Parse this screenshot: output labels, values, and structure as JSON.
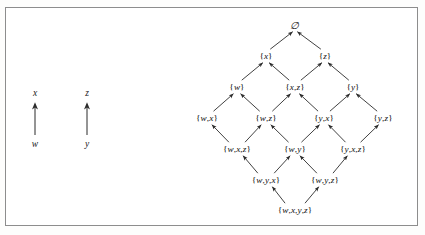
{
  "figure": {
    "background_color": "#ffffff",
    "border_color": "#8d8d8d",
    "line_color": "#2b2b2b",
    "text_color": "#111111"
  },
  "legend": {
    "pairs": [
      {
        "name": "pair-x-w",
        "top": "x",
        "bottom": "w",
        "arrow": "up-arrow-icon"
      },
      {
        "name": "pair-z-y",
        "top": "z",
        "bottom": "y",
        "arrow": "up-arrow-icon"
      }
    ]
  },
  "lattice": {
    "rows": [
      {
        "row": 1,
        "y": 25,
        "nodes": [
          {
            "id": "empty",
            "label": "∅",
            "x": 295
          }
        ]
      },
      {
        "row": 2,
        "y": 56,
        "nodes": [
          {
            "id": "x",
            "label": "{x}",
            "x": 266
          },
          {
            "id": "z",
            "label": "{z}",
            "x": 325
          }
        ]
      },
      {
        "row": 3,
        "y": 87,
        "nodes": [
          {
            "id": "w",
            "label": "{w}",
            "x": 237
          },
          {
            "id": "xz",
            "label": "{x,z}",
            "x": 295
          },
          {
            "id": "y",
            "label": "{y}",
            "x": 353
          }
        ]
      },
      {
        "row": 4,
        "y": 118,
        "nodes": [
          {
            "id": "wx",
            "label": "{w,x}",
            "x": 207
          },
          {
            "id": "wz",
            "label": "{w,z}",
            "x": 266
          },
          {
            "id": "yx",
            "label": "{y,x}",
            "x": 324
          },
          {
            "id": "yz",
            "label": "{y,z}",
            "x": 383
          }
        ]
      },
      {
        "row": 5,
        "y": 149,
        "nodes": [
          {
            "id": "wxz",
            "label": "{w,x,z}",
            "x": 237
          },
          {
            "id": "wy",
            "label": "{w,y}",
            "x": 295
          },
          {
            "id": "yxz",
            "label": "{y,x,z}",
            "x": 353
          }
        ]
      },
      {
        "row": 6,
        "y": 180,
        "nodes": [
          {
            "id": "wyx",
            "label": "{w,y,x}",
            "x": 266
          },
          {
            "id": "wyz",
            "label": "{w,y,z}",
            "x": 325
          }
        ]
      },
      {
        "row": 7,
        "y": 210,
        "nodes": [
          {
            "id": "wxyz",
            "label": "{w,x,y,z}",
            "x": 295
          }
        ]
      }
    ],
    "edges": [
      {
        "from": "x",
        "to": "empty"
      },
      {
        "from": "z",
        "to": "empty"
      },
      {
        "from": "w",
        "to": "x"
      },
      {
        "from": "xz",
        "to": "x"
      },
      {
        "from": "xz",
        "to": "z"
      },
      {
        "from": "y",
        "to": "z"
      },
      {
        "from": "wx",
        "to": "w"
      },
      {
        "from": "wz",
        "to": "w"
      },
      {
        "from": "wz",
        "to": "xz"
      },
      {
        "from": "yx",
        "to": "xz"
      },
      {
        "from": "yx",
        "to": "y"
      },
      {
        "from": "yz",
        "to": "y"
      },
      {
        "from": "wxz",
        "to": "wx"
      },
      {
        "from": "wxz",
        "to": "wz"
      },
      {
        "from": "wy",
        "to": "wz"
      },
      {
        "from": "wy",
        "to": "yx"
      },
      {
        "from": "yxz",
        "to": "yx"
      },
      {
        "from": "yxz",
        "to": "yz"
      },
      {
        "from": "wyx",
        "to": "wxz"
      },
      {
        "from": "wyx",
        "to": "wy"
      },
      {
        "from": "wyz",
        "to": "wy"
      },
      {
        "from": "wyz",
        "to": "yxz"
      },
      {
        "from": "wxyz",
        "to": "wyx"
      },
      {
        "from": "wxyz",
        "to": "wyz"
      }
    ]
  }
}
